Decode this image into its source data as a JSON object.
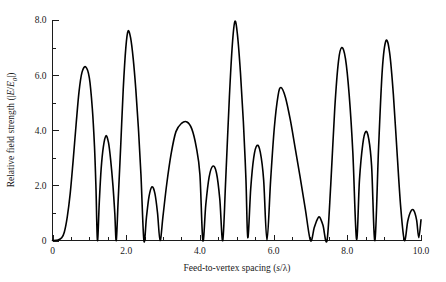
{
  "chart_data": {
    "type": "line",
    "title": "",
    "xlabel": "Feed-to-vertex spacing (s/λ)",
    "ylabel": "Relative field strength (|E/E₀|)",
    "xlim": [
      0,
      10.0
    ],
    "ylim": [
      0,
      8.0
    ],
    "grid": false,
    "legend": null,
    "x_major_ticks": [
      "0",
      "2.0",
      "4.0",
      "6.0",
      "8.0",
      "10.0"
    ],
    "x_major_tick_values": [
      0,
      2.0,
      4.0,
      6.0,
      8.0,
      10.0
    ],
    "x_minor_tick_values": [
      0.5,
      1.0,
      1.5,
      2.5,
      3.0,
      3.5,
      4.5,
      5.0,
      5.5,
      6.5,
      7.0,
      7.5,
      8.5,
      9.0,
      9.5
    ],
    "y_major_ticks": [
      "0",
      "2.0",
      "4.0",
      "6.0",
      "8.0"
    ],
    "y_major_tick_values": [
      0,
      2.0,
      4.0,
      6.0,
      8.0
    ],
    "y_minor_tick_values": [
      1.0,
      3.0,
      5.0,
      7.0
    ],
    "series": [
      {
        "name": "Relative field strength",
        "peaks": [
          {
            "x": 0.9,
            "y": 6.3
          },
          {
            "x": 1.45,
            "y": 3.8
          },
          {
            "x": 2.05,
            "y": 7.6
          },
          {
            "x": 2.7,
            "y": 1.95
          },
          {
            "x": 3.65,
            "y": 4.3
          },
          {
            "x": 4.35,
            "y": 2.7
          },
          {
            "x": 4.95,
            "y": 7.95
          },
          {
            "x": 5.55,
            "y": 3.45
          },
          {
            "x": 6.2,
            "y": 5.55
          },
          {
            "x": 7.25,
            "y": 0.85
          },
          {
            "x": 7.85,
            "y": 7.0
          },
          {
            "x": 8.5,
            "y": 3.95
          },
          {
            "x": 9.05,
            "y": 7.25
          },
          {
            "x": 9.8,
            "y": 1.1
          }
        ],
        "minima": [
          {
            "x": 0.3,
            "y": 0.0
          },
          {
            "x": 1.22,
            "y": 0.0
          },
          {
            "x": 1.73,
            "y": 0.0
          },
          {
            "x": 2.48,
            "y": 0.0
          },
          {
            "x": 2.92,
            "y": 0.0
          },
          {
            "x": 4.08,
            "y": 0.0
          },
          {
            "x": 4.62,
            "y": 0.0
          },
          {
            "x": 5.3,
            "y": 0.1
          },
          {
            "x": 5.82,
            "y": 0.0
          },
          {
            "x": 7.0,
            "y": 0.0
          },
          {
            "x": 7.45,
            "y": 0.0
          },
          {
            "x": 8.25,
            "y": 0.05
          },
          {
            "x": 8.75,
            "y": 0.0
          },
          {
            "x": 9.55,
            "y": 0.0
          },
          {
            "x": 10.0,
            "y": 0.75
          }
        ],
        "x": [
          0.0,
          0.15,
          0.25,
          0.32,
          0.4,
          0.48,
          0.56,
          0.64,
          0.72,
          0.8,
          0.9,
          1.0,
          1.08,
          1.14,
          1.18,
          1.22,
          1.27,
          1.32,
          1.38,
          1.45,
          1.52,
          1.58,
          1.64,
          1.69,
          1.73,
          1.78,
          1.85,
          1.92,
          1.99,
          2.05,
          2.12,
          2.19,
          2.26,
          2.33,
          2.4,
          2.48,
          2.55,
          2.62,
          2.7,
          2.78,
          2.85,
          2.92,
          3.0,
          3.1,
          3.22,
          3.35,
          3.5,
          3.65,
          3.78,
          3.9,
          4.0,
          4.08,
          4.16,
          4.25,
          4.35,
          4.45,
          4.54,
          4.62,
          4.7,
          4.8,
          4.88,
          4.95,
          5.02,
          5.1,
          5.18,
          5.25,
          5.3,
          5.38,
          5.46,
          5.55,
          5.64,
          5.73,
          5.82,
          5.92,
          6.02,
          6.12,
          6.2,
          6.32,
          6.45,
          6.58,
          6.72,
          6.86,
          7.0,
          7.1,
          7.18,
          7.25,
          7.34,
          7.45,
          7.55,
          7.66,
          7.76,
          7.85,
          7.95,
          8.05,
          8.15,
          8.25,
          8.33,
          8.42,
          8.5,
          8.58,
          8.66,
          8.75,
          8.85,
          8.95,
          9.05,
          9.15,
          9.25,
          9.35,
          9.45,
          9.55,
          9.64,
          9.72,
          9.8,
          9.88,
          9.94,
          10.0
        ],
        "y": [
          0.0,
          0.02,
          0.1,
          0.3,
          0.85,
          1.7,
          2.9,
          4.2,
          5.4,
          6.1,
          6.3,
          5.9,
          4.8,
          3.4,
          1.9,
          0.0,
          1.4,
          2.6,
          3.4,
          3.8,
          3.55,
          2.9,
          2.0,
          1.0,
          0.0,
          1.4,
          3.4,
          5.5,
          7.0,
          7.6,
          7.35,
          6.6,
          5.5,
          4.1,
          2.4,
          0.0,
          0.85,
          1.6,
          1.95,
          1.7,
          1.0,
          0.0,
          0.9,
          2.05,
          3.15,
          3.95,
          4.25,
          4.3,
          4.05,
          3.4,
          2.4,
          0.0,
          1.3,
          2.3,
          2.7,
          2.45,
          1.5,
          0.0,
          2.2,
          5.2,
          7.1,
          7.95,
          7.45,
          6.1,
          4.3,
          2.2,
          0.1,
          1.9,
          3.0,
          3.45,
          3.2,
          2.2,
          0.0,
          2.2,
          4.1,
          5.25,
          5.55,
          5.2,
          4.4,
          3.4,
          2.3,
          1.15,
          0.0,
          0.45,
          0.75,
          0.85,
          0.55,
          0.0,
          2.0,
          4.8,
          6.5,
          7.0,
          6.6,
          5.3,
          3.2,
          0.05,
          2.2,
          3.5,
          3.95,
          3.7,
          2.7,
          0.0,
          3.4,
          6.2,
          7.25,
          6.8,
          5.3,
          3.2,
          1.2,
          0.0,
          0.7,
          1.05,
          1.1,
          0.75,
          0.1,
          0.75
        ]
      }
    ]
  },
  "axes": {
    "x_title_prefix": "Feed-to-vertex spacing (",
    "x_title_var": "s",
    "x_title_slash": "/",
    "x_title_lambda": "λ",
    "x_title_suffix": ")",
    "y_title_prefix": "Relative field strength (|",
    "y_title_var_e": "E",
    "y_title_slash": "/",
    "y_title_var_e0": "E",
    "y_title_sub0": "0",
    "y_title_suffix": "|)"
  },
  "colors": {
    "curve": "#000000",
    "axis": "#1c1c1c",
    "background": "#ffffff",
    "text": "#1a1a1a"
  }
}
